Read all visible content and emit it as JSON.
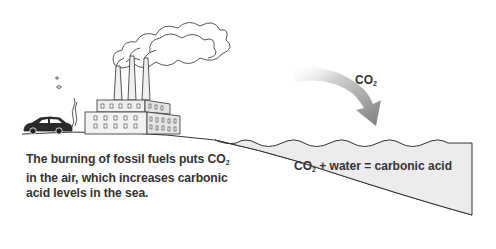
{
  "diagram": {
    "caption": {
      "part1": "The burning of fossil fuels puts CO",
      "sub": "2",
      "part2": " in the air, which increases carbonic acid levels in the sea."
    },
    "arrow_label": {
      "main": "CO",
      "sub": "2"
    },
    "sea_equation": {
      "part1": "CO",
      "sub": "2",
      "part2": " + water = carbonic acid"
    },
    "elements": [
      "car",
      "exhaust",
      "factory",
      "smokestacks",
      "smoke-clouds",
      "co2-arrow",
      "sea",
      "land"
    ],
    "colors": {
      "sea_fill": "#ececec",
      "line": "#333333",
      "arrow": "#8a8a8a",
      "building": "#efefef"
    }
  }
}
